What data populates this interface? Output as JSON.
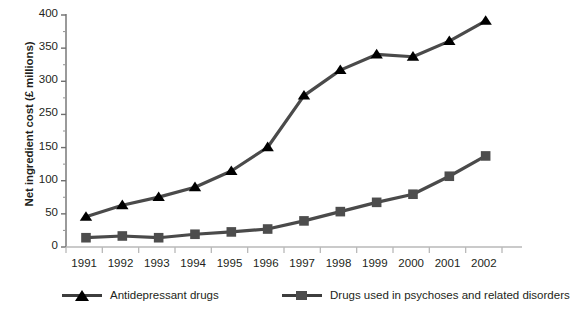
{
  "chart_data": {
    "type": "line",
    "title": "",
    "xlabel": "",
    "ylabel": "Net ingredient cost (£ millions)",
    "categories": [
      "1991",
      "1992",
      "1993",
      "1994",
      "1995",
      "1996",
      "1997",
      "1998",
      "1999",
      "2000",
      "2001",
      "2002"
    ],
    "ylim": [
      0,
      400
    ],
    "yticks": [
      0,
      50,
      100,
      150,
      250,
      300,
      350,
      400
    ],
    "ytick_labels": [
      "0",
      "50",
      "100",
      "150",
      "250",
      "300",
      "350",
      "400"
    ],
    "grid": false,
    "legend_position": "bottom",
    "series": [
      {
        "name": "Antidepressant drugs",
        "marker": "triangle",
        "color": "#000000",
        "line_color": "#4a4a4a",
        "values": [
          52,
          72,
          86,
          103,
          131,
          172,
          261,
          305,
          332,
          328,
          355,
          390
        ]
      },
      {
        "name": "Drugs used in psychoses and related disorders",
        "marker": "square",
        "color": "#4d4d4d",
        "line_color": "#4a4a4a",
        "values": [
          16,
          19,
          16,
          22,
          26,
          31,
          45,
          61,
          77,
          91,
          122,
          157
        ]
      }
    ]
  },
  "legend": {
    "items": [
      {
        "label": "Antidepressant drugs",
        "marker": "triangle"
      },
      {
        "label": "Drugs used in psychoses and related disorders",
        "marker": "square"
      }
    ]
  },
  "source_note": ""
}
